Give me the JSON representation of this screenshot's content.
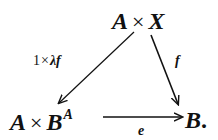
{
  "diagram": {
    "type": "commutative-triangle",
    "nodes": {
      "top": {
        "left": "A",
        "op": "×",
        "right": "X"
      },
      "bottom_left": {
        "left": "A",
        "op": "×",
        "right": "B",
        "superscript": "A"
      },
      "bottom_right": {
        "text": "B",
        "punct": "."
      }
    },
    "arrows": {
      "diagonal_left": {
        "from": "top",
        "to": "bottom_left",
        "label_one": "1",
        "label_op": "×",
        "label_rest": "λf"
      },
      "diagonal_right": {
        "from": "top",
        "to": "bottom_right",
        "label": "f"
      },
      "bottom": {
        "from": "bottom_left",
        "to": "bottom_right",
        "label": "e"
      }
    },
    "colors": {
      "ink": "#111111",
      "background": "#ffffff"
    }
  }
}
